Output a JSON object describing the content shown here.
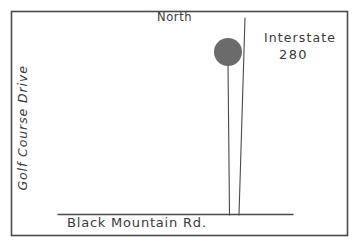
{
  "map": {
    "title": "Hand-drawn location map",
    "background_color": "#ffffff",
    "ink_color": "#3a3a3a",
    "border": {
      "name": "map-frame",
      "color": "#4a4a4a",
      "x": 11,
      "y": 11,
      "width": 337,
      "height": 225
    },
    "labels": {
      "north": "North",
      "interstate_name": "Interstate",
      "interstate_number": "280",
      "golf_course_drive": "Golf Course Drive",
      "black_mountain_rd": "Black Mountain Rd."
    },
    "roads": [
      {
        "name": "golf-course-drive",
        "label": "Golf Course Drive",
        "orientation": "vertical",
        "stroke_color": "#4a4a4a",
        "stroke_width": 1.1,
        "x1": 228,
        "y1": 66,
        "x2": 229,
        "y2": 215
      },
      {
        "name": "interstate-280",
        "label": "Interstate 280",
        "orientation": "vertical-slanted",
        "stroke_color": "#4a4a4a",
        "stroke_width": 1.1,
        "x1": 245,
        "y1": 18,
        "x2": 239,
        "y2": 215
      },
      {
        "name": "black-mountain-rd",
        "label": "Black Mountain Rd.",
        "orientation": "horizontal",
        "stroke_color": "#4a4a4a",
        "stroke_width": 1.4,
        "x1": 58,
        "y1": 214,
        "x2": 293,
        "y2": 214
      }
    ],
    "markers": [
      {
        "name": "location-marker-dot",
        "shape": "circle",
        "fill_color": "#6b6b6b",
        "cx": 228,
        "cy": 52,
        "r": 14
      }
    ],
    "compass": {
      "direction": "North",
      "points_up": true
    }
  }
}
